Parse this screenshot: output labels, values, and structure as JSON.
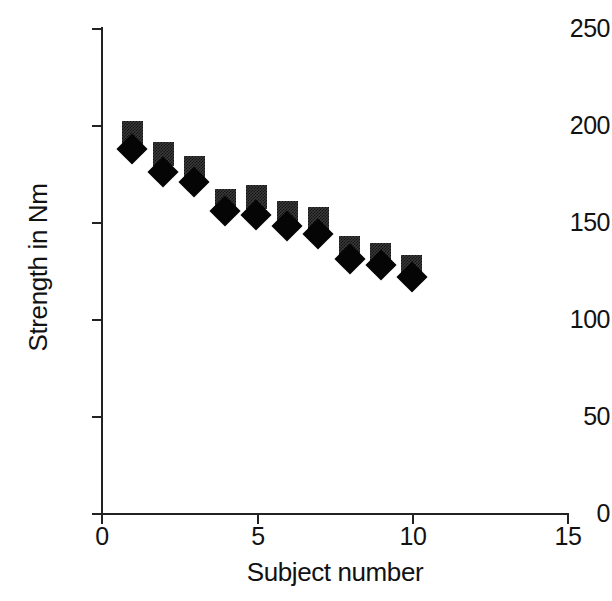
{
  "chart_data": {
    "type": "scatter",
    "title": "",
    "xlabel": "Subject number",
    "ylabel": "Strength in Nm",
    "xlim": [
      0,
      15
    ],
    "ylim": [
      0,
      250
    ],
    "xticks": [
      "0",
      "5",
      "10",
      "15"
    ],
    "xtick_values": [
      0,
      5,
      10,
      15
    ],
    "yticks": [
      "0",
      "50",
      "100",
      "150",
      "200",
      "250"
    ],
    "ytick_values": [
      0,
      50,
      100,
      150,
      200,
      250
    ],
    "grid": false,
    "legend": "none",
    "x": [
      1,
      2,
      3,
      4,
      5,
      6,
      7,
      8,
      9,
      10
    ],
    "series": [
      {
        "name": "square-series",
        "marker": "square",
        "color": "#3a3a3a",
        "values": [
          196,
          185,
          178,
          161,
          163,
          155,
          152,
          137,
          133,
          127
        ]
      },
      {
        "name": "diamond-series",
        "marker": "diamond",
        "color": "#050505",
        "values": [
          188,
          176,
          171,
          156,
          154,
          148,
          144,
          131,
          128,
          122
        ]
      }
    ]
  },
  "axes": {
    "x_title": "Subject number",
    "y_title": "Strength in Nm",
    "x_tick_labels": [
      "0",
      "5",
      "10",
      "15"
    ],
    "y_tick_labels": [
      "0",
      "50",
      "100",
      "150",
      "200",
      "250"
    ]
  }
}
